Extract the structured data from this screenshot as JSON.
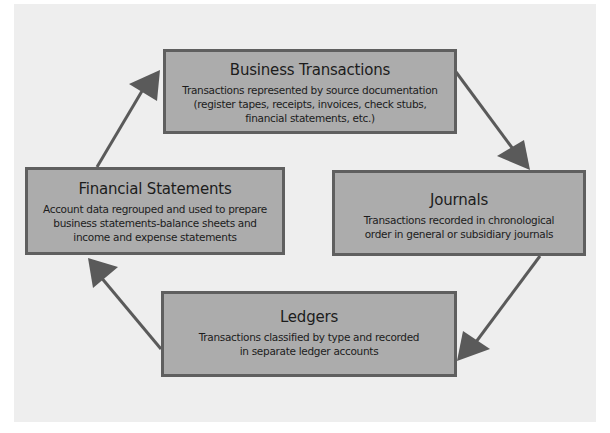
{
  "diagram": {
    "type": "cycle",
    "colors": {
      "background": "#eeeeee",
      "box_fill": "#acacac",
      "box_border": "#5f5f5f",
      "arrow": "#5a5a5a",
      "text": "#1c1c1c"
    },
    "nodes": [
      {
        "id": "business",
        "title": "Business Transactions",
        "lines": [
          "Transactions represented by source documentation",
          "(register tapes, receipts, invoices, check stubs,",
          "financial statements, etc.)"
        ]
      },
      {
        "id": "journals",
        "title": "Journals",
        "lines": [
          "Transactions recorded in chronological",
          "order in general or subsidiary journals"
        ]
      },
      {
        "id": "ledgers",
        "title": "Ledgers",
        "lines": [
          "Transactions classified by type and recorded",
          "in separate ledger accounts"
        ]
      },
      {
        "id": "financial",
        "title": "Financial Statements",
        "lines": [
          "Account data regrouped and used to prepare",
          "business statements-balance sheets and",
          "income and expense statements"
        ]
      }
    ],
    "edges": [
      {
        "from": "business",
        "to": "journals"
      },
      {
        "from": "journals",
        "to": "ledgers"
      },
      {
        "from": "ledgers",
        "to": "financial"
      },
      {
        "from": "financial",
        "to": "business"
      }
    ]
  }
}
